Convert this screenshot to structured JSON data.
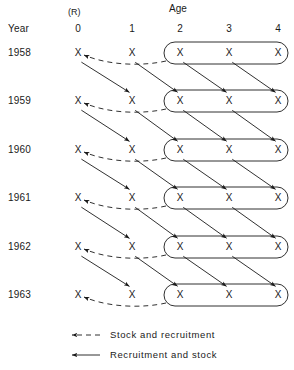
{
  "figure": {
    "type": "cohort-matrix-diagram",
    "axis_title": "Age",
    "year_axis_title": "Year",
    "recruitment_header": "(R)",
    "cell_symbol": "X"
  },
  "columns": {
    "header_label": "Age",
    "ages": [
      "0",
      "1",
      "2",
      "3",
      "4"
    ],
    "x_positions": [
      78,
      132,
      180,
      229,
      278
    ],
    "recruitment_column_index": 0,
    "grouped_ages": [
      "2",
      "3",
      "4"
    ],
    "group_box": {
      "x": 164,
      "width": 124,
      "height": 22,
      "radius": 11
    }
  },
  "rows": {
    "header_label": "Year",
    "years": [
      "1958",
      "1959",
      "1960",
      "1961",
      "1962",
      "1963"
    ],
    "y_positions": [
      53,
      101,
      150,
      198,
      247,
      295
    ],
    "label_x": 8
  },
  "cells": [
    {
      "year": "1958",
      "ages": [
        "X",
        "X",
        "X",
        "X",
        "X"
      ]
    },
    {
      "year": "1959",
      "ages": [
        "X",
        "X",
        "X",
        "X",
        "X"
      ]
    },
    {
      "year": "1960",
      "ages": [
        "X",
        "X",
        "X",
        "X",
        "X"
      ]
    },
    {
      "year": "1961",
      "ages": [
        "X",
        "X",
        "X",
        "X",
        "X"
      ]
    },
    {
      "year": "1962",
      "ages": [
        "X",
        "X",
        "X",
        "X",
        "X"
      ]
    },
    {
      "year": "1963",
      "ages": [
        "X",
        "X",
        "X",
        "X",
        "X"
      ]
    }
  ],
  "legend": {
    "items": [
      {
        "style": "dashed",
        "label": "Stock and recruitment",
        "arrow": "left"
      },
      {
        "style": "solid",
        "label": "Recruitment and stock",
        "arrow": "left"
      }
    ],
    "x_arrow_start": 72,
    "x_arrow_end": 100,
    "x_text": 110,
    "y_positions": [
      335,
      355
    ]
  },
  "style": {
    "line_color": "#1a1a1a",
    "text_color": "#1a1a1a",
    "background": "#ffffff",
    "dash_pattern": "5,4",
    "stroke_width": 0.9
  },
  "header_positions": {
    "age_title_x": 178,
    "age_title_y": 9,
    "rec_header_x": 78,
    "rec_header_y": 12,
    "col_head_y": 29,
    "year_head_x": 8,
    "year_head_y": 29
  }
}
